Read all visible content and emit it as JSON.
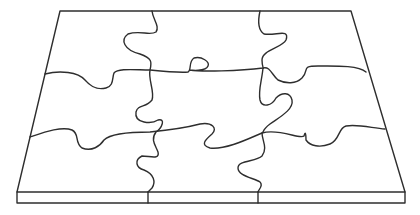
{
  "figure": {
    "grid": {
      "rows": 3,
      "columns": 3
    },
    "stroke_color": "#2e2e2e",
    "background_color": "#ffffff"
  }
}
